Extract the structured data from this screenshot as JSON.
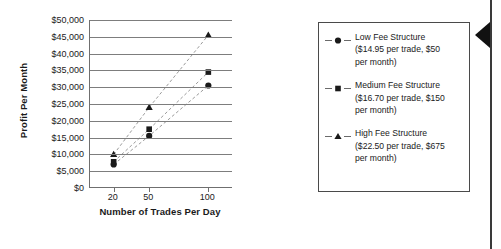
{
  "chart_data": {
    "type": "scatter",
    "title": "",
    "xlabel": "Number of Trades Per Day",
    "ylabel": "Profit Per Month",
    "x": [
      20,
      50,
      100
    ],
    "xtick_labels": [
      "20",
      "50",
      "100"
    ],
    "xlim": [
      0,
      120
    ],
    "ylim": [
      0,
      50000
    ],
    "ytick_labels": [
      "$50,000",
      "$45,000",
      "$40,000",
      "$35,000",
      "$30,000",
      "$25,000",
      "$20,000",
      "$15,000",
      "$10,000",
      "$5,000",
      "$0"
    ],
    "ytick_values": [
      50000,
      45000,
      40000,
      35000,
      30000,
      25000,
      20000,
      15000,
      10000,
      5000,
      0
    ],
    "grid": "horizontal",
    "legend_position": "right",
    "line_style": "dashed",
    "series": [
      {
        "name": "Low Fee Structure",
        "marker": "circle",
        "values": [
          7000,
          15500,
          30500
        ]
      },
      {
        "name": "Medium Fee Structure",
        "marker": "square",
        "values": [
          7800,
          17500,
          34500
        ]
      },
      {
        "name": "High Fee Structure",
        "marker": "triangle",
        "values": [
          10000,
          24000,
          45500
        ]
      }
    ]
  },
  "axes": {
    "y_title": "Profit Per Month",
    "x_title": "Number of Trades Per Day",
    "y_ticks": [
      {
        "label": "$50,000"
      },
      {
        "label": "$45,000"
      },
      {
        "label": "$40,000"
      },
      {
        "label": "$35,000"
      },
      {
        "label": "$30,000"
      },
      {
        "label": "$25,000"
      },
      {
        "label": "$20,000"
      },
      {
        "label": "$15,000"
      },
      {
        "label": "$10,000"
      },
      {
        "label": "$5,000"
      },
      {
        "label": "$0"
      }
    ],
    "x_ticks": [
      {
        "label": "20"
      },
      {
        "label": "50"
      },
      {
        "label": "100"
      }
    ]
  },
  "legend": {
    "entries": [
      {
        "marker": "circle",
        "label": "Low Fee Structure\n($14.95 per trade, $50\nper month)"
      },
      {
        "marker": "square",
        "label": "Medium Fee Structure\n($16.70 per trade, $150\nper month)"
      },
      {
        "marker": "triangle",
        "label": "High Fee Structure\n($22.50 per trade, $675\nper month)"
      }
    ]
  },
  "page_edge": {
    "arrow_icon": "left-arrow-icon"
  },
  "colors": {
    "marker": "#1a1a1a",
    "gridline": "#7d7d7d",
    "axis": "#6f6f6f",
    "legend_border": "#4a4a4a",
    "edge_arrow": "#111111"
  }
}
